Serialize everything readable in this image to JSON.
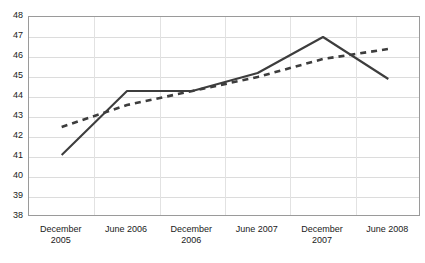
{
  "chart_data": {
    "type": "line",
    "title": "",
    "subtitle": "",
    "xlabel": "",
    "ylabel": "",
    "categories": [
      "December 2005",
      "June 2006",
      "December 2006",
      "June 2007",
      "December 2007",
      "June 2008"
    ],
    "category_lines": [
      [
        "December",
        "2005"
      ],
      [
        "June 2006",
        ""
      ],
      [
        "December",
        "2006"
      ],
      [
        "June 2007",
        ""
      ],
      [
        "December",
        "2007"
      ],
      [
        "June 2008",
        ""
      ]
    ],
    "series": [
      {
        "name": "solid-series",
        "style": "solid",
        "color": "#3d3d3d",
        "values": [
          41.1,
          44.3,
          44.3,
          45.2,
          47.0,
          44.9
        ]
      },
      {
        "name": "dashed-series",
        "style": "dashed",
        "color": "#3d3d3d",
        "values": [
          42.5,
          43.6,
          44.3,
          45.0,
          45.9,
          46.4
        ]
      }
    ],
    "ylim": [
      38,
      48
    ],
    "ytick_step": 1,
    "yticks": [
      48,
      47,
      46,
      45,
      44,
      43,
      42,
      41,
      40,
      39,
      38
    ],
    "ytick_labels": [
      "48",
      "47",
      "46",
      "45",
      "44",
      "43",
      "42",
      "41",
      "40",
      "39",
      "38"
    ],
    "grid": {
      "horizontal": true,
      "vertical": true,
      "color": "#dcdcdc"
    },
    "legend": {
      "visible": false,
      "position": "none",
      "entries": []
    },
    "plot_border_color": "#9a9a9a",
    "background_color": "#ffffff"
  }
}
